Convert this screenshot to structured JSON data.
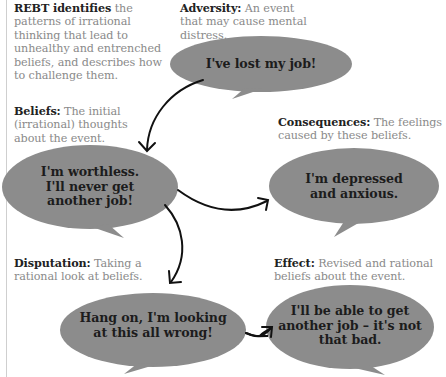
{
  "intro": {
    "heading": "REBT identifies",
    "text": " the patterns of irrational thinking that lead to unhealthy and entrenched beliefs, and describes how to challenge them."
  },
  "stages": {
    "adversity": {
      "label": "Adversity:",
      "description": " An event that may cause mental distress.",
      "bubble_text": "I've lost my job!"
    },
    "beliefs": {
      "label": "Beliefs:",
      "description": " The initial (irrational) thoughts about the event.",
      "bubble_lines": [
        "I'm worthless.",
        "I'll never get",
        "another job!"
      ]
    },
    "consequences": {
      "label": "Consequences:",
      "description": " The feelings caused by these beliefs.",
      "bubble_lines": [
        "I'm depressed",
        "and anxious."
      ]
    },
    "disputation": {
      "label": "Disputation:",
      "description": " Taking a rational look at beliefs.",
      "bubble_lines": [
        "Hang on, I'm looking",
        "at this all wrong!"
      ]
    },
    "effect": {
      "label": "Effect:",
      "description": " Revised and rational beliefs about the event.",
      "bubble_lines": [
        "I'll be able to get",
        "another job – it's not",
        "that bad."
      ]
    }
  },
  "colors": {
    "bubble_fill": "#8c8c8c",
    "arrow": "#111111",
    "caption_gray": "#8a8a8a",
    "left_rule": "#cfcfcf"
  },
  "arrows": [
    {
      "from": "adversity",
      "to": "beliefs"
    },
    {
      "from": "beliefs",
      "to": "consequences"
    },
    {
      "from": "beliefs",
      "to": "disputation"
    },
    {
      "from": "disputation",
      "to": "effect"
    }
  ]
}
